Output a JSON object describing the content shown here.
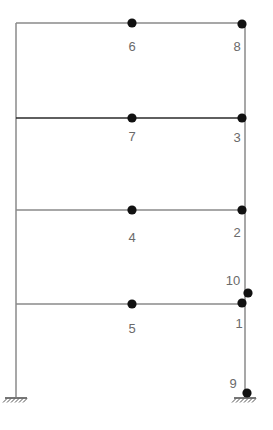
{
  "diagram": {
    "type": "structural-frame",
    "colors": {
      "member": "#8a8a8a",
      "member_dark": "#2a2a2a",
      "node": "#111111",
      "label": "#6a6a6a",
      "support": "#555555"
    },
    "columns": [
      {
        "id": "left-column",
        "x": 16,
        "y1": 23,
        "y2": 397
      },
      {
        "id": "right-column",
        "x": 245,
        "y1": 23,
        "y2": 397
      }
    ],
    "beams": [
      {
        "id": "beam-roof",
        "y": 23,
        "x1": 16,
        "x2": 245,
        "emphasis": false
      },
      {
        "id": "beam-level-3",
        "y": 118,
        "x1": 16,
        "x2": 245,
        "emphasis": true
      },
      {
        "id": "beam-level-2",
        "y": 210,
        "x1": 16,
        "x2": 245,
        "emphasis": false
      },
      {
        "id": "beam-level-1",
        "y": 304,
        "x1": 16,
        "x2": 245,
        "emphasis": false
      }
    ],
    "nodes": [
      {
        "id": "1",
        "label": "1",
        "x": 242,
        "y": 303,
        "lx": 239,
        "ly": 328
      },
      {
        "id": "2",
        "label": "2",
        "x": 242,
        "y": 210,
        "lx": 237,
        "ly": 237
      },
      {
        "id": "3",
        "label": "3",
        "x": 242,
        "y": 118,
        "lx": 237,
        "ly": 142
      },
      {
        "id": "4",
        "label": "4",
        "x": 132,
        "y": 210,
        "lx": 132,
        "ly": 242
      },
      {
        "id": "5",
        "label": "5",
        "x": 132,
        "y": 304,
        "lx": 132,
        "ly": 333
      },
      {
        "id": "6",
        "label": "6",
        "x": 132,
        "y": 23,
        "lx": 132,
        "ly": 51
      },
      {
        "id": "7",
        "label": "7",
        "x": 132,
        "y": 118,
        "lx": 132,
        "ly": 141
      },
      {
        "id": "8",
        "label": "8",
        "x": 242,
        "y": 24,
        "lx": 237,
        "ly": 51
      },
      {
        "id": "9",
        "label": "9",
        "x": 247,
        "y": 393,
        "lx": 233,
        "ly": 388
      },
      {
        "id": "10",
        "label": "10",
        "x": 248,
        "y": 293,
        "lx": 233,
        "ly": 285
      }
    ],
    "supports": [
      {
        "id": "left-fixed-support",
        "x": 16,
        "y": 397
      },
      {
        "id": "right-fixed-support",
        "x": 245,
        "y": 397
      }
    ]
  }
}
